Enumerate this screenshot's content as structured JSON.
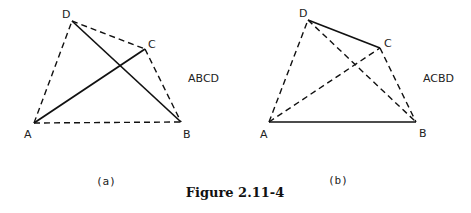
{
  "figure": {
    "title": "Figure 2.11-4",
    "panels": [
      {
        "caption": "(a)",
        "tour_label": "ABCD",
        "points": {
          "A": "A",
          "B": "B",
          "C": "C",
          "D": "D"
        },
        "solid_edges": [
          "AC",
          "DB"
        ],
        "dashed_edges": [
          "AD",
          "DC",
          "CB",
          "AB"
        ]
      },
      {
        "caption": "(b)",
        "tour_label": "ACBD",
        "points": {
          "A": "A",
          "B": "B",
          "C": "C",
          "D": "D"
        },
        "solid_edges": [
          "DC",
          "AB"
        ],
        "dashed_edges": [
          "AD",
          "AC",
          "DB",
          "CB"
        ]
      }
    ]
  }
}
